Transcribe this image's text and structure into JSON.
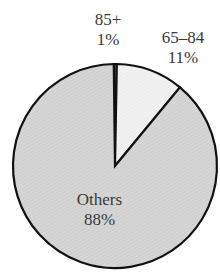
{
  "chart_data": {
    "type": "pie",
    "title": "",
    "categories": [
      "85+",
      "65–84",
      "Others"
    ],
    "values": [
      1,
      11,
      88
    ],
    "value_labels": [
      "1%",
      "11%",
      "88%"
    ],
    "colors": [
      "#888888",
      "#f0f0f0",
      "#d4d4d4"
    ],
    "start_angle_deg": 0,
    "direction": "clockwise",
    "legend": "none",
    "labels_position": [
      "outside-top",
      "outside-top-right",
      "inside"
    ]
  },
  "labels": {
    "s85": {
      "name": "85+",
      "pct": "1%"
    },
    "s65": {
      "name": "65–84",
      "pct": "11%"
    },
    "others": {
      "name": "Others",
      "pct": "88%"
    }
  }
}
